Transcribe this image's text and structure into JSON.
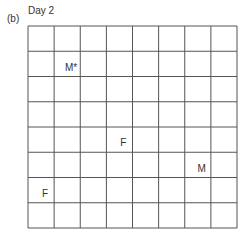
{
  "figure": {
    "panel_label": "(b)",
    "title": "Day 2"
  },
  "grid": {
    "columns": 8,
    "rows": 8,
    "line_color": "#555555"
  },
  "markers": [
    {
      "label": "M*",
      "col": 2,
      "row": 2
    },
    {
      "label": "F",
      "col": 4,
      "row": 5
    },
    {
      "label": "M",
      "col": 7,
      "row": 6
    },
    {
      "label": "F",
      "col": 1,
      "row": 7
    }
  ]
}
